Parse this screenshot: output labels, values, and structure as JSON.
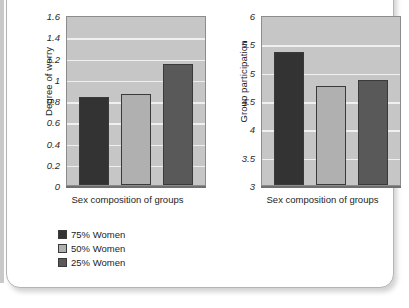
{
  "figure": {
    "frame_border_color": "#b4b4b4",
    "plot_background_color": "#c6c6c6",
    "gridline_color": "#f0f0f0"
  },
  "legend": {
    "position": "below-left",
    "items": [
      {
        "label": "75% Women",
        "color": "#333333"
      },
      {
        "label": "50% Women",
        "color": "#b0b0b0"
      },
      {
        "label": "25% Women",
        "color": "#595959"
      }
    ]
  },
  "chart_data": [
    {
      "type": "bar",
      "id": "degree-of-worry",
      "title": "",
      "xlabel": "Sex composition of groups",
      "ylabel": "Degree of worry",
      "categories": [
        "75% Women",
        "50% Women",
        "25% Women"
      ],
      "values": [
        0.83,
        0.86,
        1.14
      ],
      "colors": [
        "#333333",
        "#b0b0b0",
        "#595959"
      ],
      "ylim": [
        0,
        1.6
      ],
      "yticks": [
        1.6,
        1.4,
        1.2,
        1,
        0.8,
        0.6,
        0.4,
        0.2,
        0
      ],
      "ytick_labels": [
        "1.6",
        "1.4",
        "1.2",
        "1",
        "0.8",
        "0.6",
        "0.4",
        "0.2",
        "0"
      ],
      "grid": true
    },
    {
      "type": "bar",
      "id": "group-participation",
      "title": "",
      "xlabel": "Sex composition of groups",
      "ylabel": "Group participation",
      "categories": [
        "75% Women",
        "50% Women",
        "25% Women"
      ],
      "values": [
        5.35,
        4.75,
        4.85
      ],
      "colors": [
        "#333333",
        "#b0b0b0",
        "#595959"
      ],
      "ylim": [
        3,
        6
      ],
      "yticks": [
        6,
        5.5,
        5,
        4.5,
        4,
        3.5,
        3
      ],
      "ytick_labels": [
        "6",
        "5.5",
        "5",
        "4.5",
        "4",
        "3.5",
        "3"
      ],
      "grid": true
    }
  ]
}
